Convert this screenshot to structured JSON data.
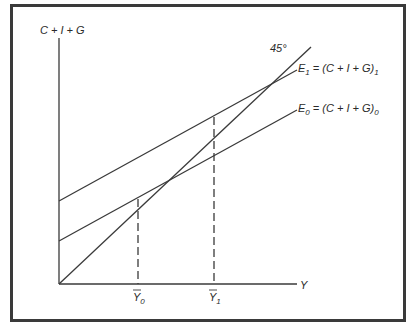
{
  "diagram": {
    "type": "keynesian-cross",
    "y_axis_label": "C + I + G",
    "x_axis_label": "Y",
    "reference_line_label": "45°",
    "lines": [
      {
        "id": "E1",
        "label_main": "E",
        "label_sub": "1",
        "label_rest": " = (C + I + G)",
        "label_rest_sub": "1"
      },
      {
        "id": "E0",
        "label_main": "E",
        "label_sub": "0",
        "label_rest": " = (C + I + G)",
        "label_rest_sub": "0"
      }
    ],
    "equilibria": [
      {
        "label": "Y",
        "sub": "0"
      },
      {
        "label": "Y",
        "sub": "1"
      }
    ],
    "colors": {
      "line": "#3a3a3a",
      "frame": "#3a3a3a",
      "background": "#ffffff"
    }
  }
}
